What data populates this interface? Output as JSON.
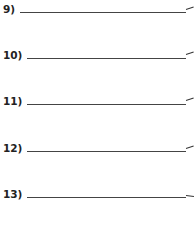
{
  "worksheet": {
    "items": [
      {
        "label": "9)",
        "answer": ""
      },
      {
        "label": "10)",
        "answer": ""
      },
      {
        "label": "11)",
        "answer": ""
      },
      {
        "label": "12)",
        "answer": ""
      },
      {
        "label": "13)",
        "answer": ""
      }
    ]
  }
}
